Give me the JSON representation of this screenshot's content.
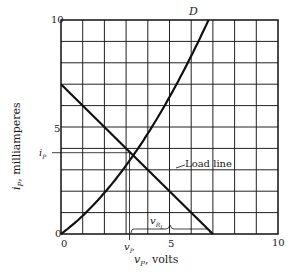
{
  "chart_data": {
    "type": "line",
    "title": "",
    "xlabel": "vP, volts",
    "ylabel": "iP, milliamperes",
    "xlim": [
      0,
      10
    ],
    "ylim": [
      0,
      10
    ],
    "grid": true,
    "x_ticks": [
      "0",
      "5",
      "10"
    ],
    "y_ticks": [
      "0",
      "5",
      "10"
    ],
    "series": [
      {
        "name": "D",
        "description": "Diode characteristic curve",
        "x": [
          0,
          1,
          2,
          3,
          3.2,
          4,
          5,
          6,
          6.8
        ],
        "y": [
          0,
          0.9,
          2.1,
          3.5,
          3.8,
          5.1,
          6.7,
          8.5,
          10
        ]
      },
      {
        "name": "Load line",
        "x": [
          0,
          7
        ],
        "y": [
          7,
          0
        ]
      }
    ],
    "annotations": [
      {
        "text": "D",
        "x": 6.8,
        "y": 10.2
      },
      {
        "text": "Load line",
        "x": 5.1,
        "y": 4.3
      },
      {
        "text": "iP",
        "x": -0.6,
        "y": 3.8,
        "note": "operating-point current marker"
      },
      {
        "text": "vP",
        "x": 3.2,
        "y": -0.7,
        "note": "operating-point voltage marker"
      },
      {
        "text": "vRL",
        "x": 4.0,
        "y": 0.8,
        "note": "brace spanning vP to 7 V"
      }
    ],
    "operating_point": {
      "vP": 3.2,
      "iP": 3.8
    }
  },
  "labels": {
    "curve": "D",
    "load_line": "Load line",
    "ip_marker": "i",
    "ip_sub": "P",
    "vp_marker": "v",
    "vp_sub": "P",
    "vrl": "v",
    "vrl_sub": "R",
    "vrl_subsub": "L",
    "x_axis_var": "v",
    "x_axis_sub": "P",
    "x_axis_unit": ", volts",
    "y_axis_var": "i",
    "y_axis_sub": "P",
    "y_axis_unit": ", milliamperes",
    "x0": "0",
    "x5": "5",
    "x10": "10",
    "y0": "0",
    "y5": "5",
    "y10": "10"
  }
}
